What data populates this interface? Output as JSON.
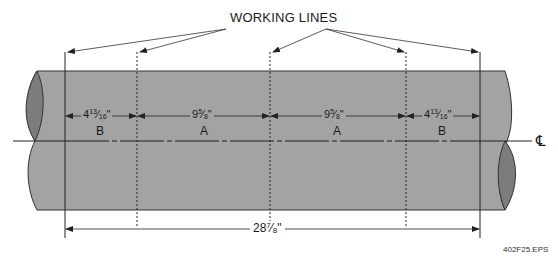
{
  "diagram": {
    "title": "WORKING LINES",
    "figure_id": "402F25.EPS",
    "centerline_symbol": "℄",
    "colors": {
      "pipe_fill": "#a3a3a3",
      "pipe_end_fill": "#7c7c7c",
      "line": "#222222",
      "background": "#ffffff"
    },
    "segments": [
      {
        "letter": "B",
        "dimension": "4 13/16\"",
        "whole": "4",
        "num": "13",
        "den": "16"
      },
      {
        "letter": "A",
        "dimension": "9 5/8\"",
        "whole": "9",
        "num": "5",
        "den": "8"
      },
      {
        "letter": "A",
        "dimension": "9 5/8\"",
        "whole": "9",
        "num": "5",
        "den": "8"
      },
      {
        "letter": "B",
        "dimension": "4 13/16\"",
        "whole": "4",
        "num": "13",
        "den": "16"
      }
    ],
    "total": {
      "dimension": "28 7/8\"",
      "whole": "28",
      "num": "7",
      "den": "8"
    },
    "working_lines": [
      {
        "position": "left-end",
        "style": "solid"
      },
      {
        "position": "A-B-left",
        "style": "dashed"
      },
      {
        "position": "center",
        "style": "dashed"
      },
      {
        "position": "A-B-right",
        "style": "dashed"
      },
      {
        "position": "right-end",
        "style": "solid"
      }
    ],
    "inch_mark": "\""
  }
}
